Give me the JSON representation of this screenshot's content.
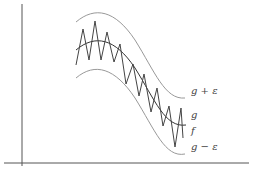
{
  "diagram": {
    "labels": {
      "upper": "g + ε",
      "middle": "g",
      "f": "f",
      "lower": "g − ε"
    },
    "colors": {
      "axes": "#555555",
      "band": "#999999",
      "g": "#333333",
      "f": "#444444"
    }
  }
}
